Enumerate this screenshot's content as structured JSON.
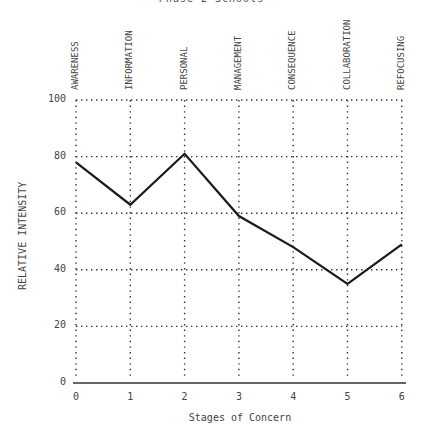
{
  "title_partial": "Phase 2 Schools",
  "chart_data": {
    "type": "line",
    "title": "Phase 2 Schools",
    "xlabel": "Stages of Concern",
    "ylabel": "RELATIVE INTENSITY",
    "x": [
      0,
      1,
      2,
      3,
      4,
      5,
      6
    ],
    "categories": [
      "AWARENESS",
      "INFORMATION",
      "PERSONAL",
      "MANAGEMENT",
      "CONSEQUENCE",
      "COLLABORATION",
      "REFOCUSING"
    ],
    "series": [
      {
        "name": "Relative Intensity",
        "values": [
          78,
          63,
          81,
          59,
          48,
          35,
          49
        ]
      }
    ],
    "ylim": [
      0,
      100
    ],
    "yticks": [
      0,
      20,
      40,
      60,
      80,
      100
    ],
    "xticks": [
      "0",
      "1",
      "2",
      "3",
      "4",
      "5",
      "6"
    ],
    "grid": true,
    "grid_style": "dotted",
    "legend": "none"
  },
  "colors": {
    "line": "#1a1a1a",
    "grid": "#333333",
    "text": "#444444"
  }
}
